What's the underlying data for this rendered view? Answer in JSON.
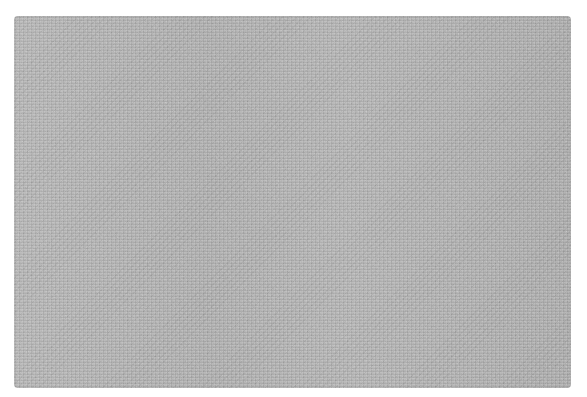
{
  "image": {
    "subject": "gray textured rug",
    "background_color": "#ffffff",
    "rug_color": "#b4b4b4"
  }
}
